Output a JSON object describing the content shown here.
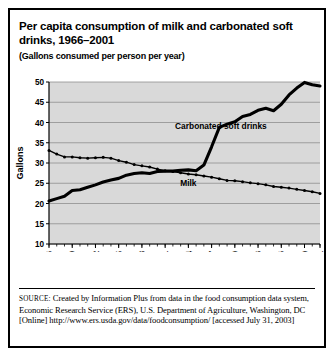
{
  "figure": {
    "title": "Per capita consumption of milk and carbonated soft drinks, 1966–2001",
    "subtitle": "(Gallons consumed per person per year)",
    "source_label": "SOURCE:",
    "source_text": " Created by Information Plus from data in the food consumption data system, Economic Research Service (ERS), U.S. Department of Agriculture, Washington, DC [Online] http://www.ers.usda.gov/data/foodconsumption/ [accessed July 31, 2003]"
  },
  "chart_data": {
    "type": "line",
    "title": "Per capita consumption of milk and carbonated soft drinks, 1966–2001",
    "xlabel": "",
    "ylabel": "Gallons",
    "ylim": [
      10,
      50
    ],
    "ytick_labels": [
      "10",
      "15",
      "20",
      "25",
      "30",
      "35",
      "40",
      "45",
      "50"
    ],
    "yticks": [
      10,
      15,
      20,
      25,
      30,
      35,
      40,
      45,
      50
    ],
    "xlim": [
      1966,
      2001
    ],
    "xtick_labels": [
      "1966",
      "1969",
      "1972",
      "1975",
      "1978",
      "1981",
      "1984",
      "1987",
      "1990",
      "1993",
      "1996",
      "1999",
      "2001"
    ],
    "xticks": [
      1966,
      1969,
      1972,
      1975,
      1978,
      1981,
      1984,
      1987,
      1990,
      1993,
      1996,
      1999,
      2001
    ],
    "grid": "horizontal",
    "legend": "inline-annotations",
    "plot_background": "#d9d9d9",
    "x": [
      1966,
      1967,
      1968,
      1969,
      1970,
      1971,
      1972,
      1973,
      1974,
      1975,
      1976,
      1977,
      1978,
      1979,
      1980,
      1981,
      1982,
      1983,
      1984,
      1985,
      1986,
      1987,
      1988,
      1989,
      1990,
      1991,
      1992,
      1993,
      1994,
      1995,
      1996,
      1997,
      1998,
      1999,
      2000,
      2001
    ],
    "series": [
      {
        "name": "Carbonated soft drinks",
        "label": "Carbonated soft drinks",
        "color": "#000000",
        "style": "solid-thick",
        "values": [
          20.6,
          21.2,
          21.8,
          23.2,
          23.4,
          24.0,
          24.6,
          25.3,
          25.8,
          26.2,
          27.0,
          27.4,
          27.6,
          27.4,
          27.9,
          28.0,
          28.0,
          28.2,
          28.3,
          28.1,
          29.5,
          34.0,
          38.8,
          39.6,
          40.2,
          41.5,
          42.0,
          43.0,
          43.5,
          42.9,
          44.5,
          46.8,
          48.5,
          49.9,
          49.3,
          49.0
        ]
      },
      {
        "name": "Milk",
        "label": "Milk",
        "color": "#000000",
        "style": "dotted",
        "values": [
          33.1,
          32.2,
          31.5,
          31.5,
          31.3,
          31.2,
          31.3,
          31.4,
          31.2,
          30.6,
          30.2,
          29.6,
          29.3,
          29.0,
          28.5,
          28.1,
          27.9,
          27.6,
          27.3,
          27.1,
          26.8,
          26.5,
          26.1,
          25.7,
          25.6,
          25.4,
          25.1,
          24.9,
          24.6,
          24.2,
          24.0,
          23.8,
          23.5,
          23.2,
          22.9,
          22.5
        ]
      }
    ],
    "annotations": [
      {
        "text": "Carbonated soft drinks",
        "x": 1988.2,
        "y": 38.5
      },
      {
        "text": "Milk",
        "x": 1984.0,
        "y": 24.2
      }
    ]
  }
}
